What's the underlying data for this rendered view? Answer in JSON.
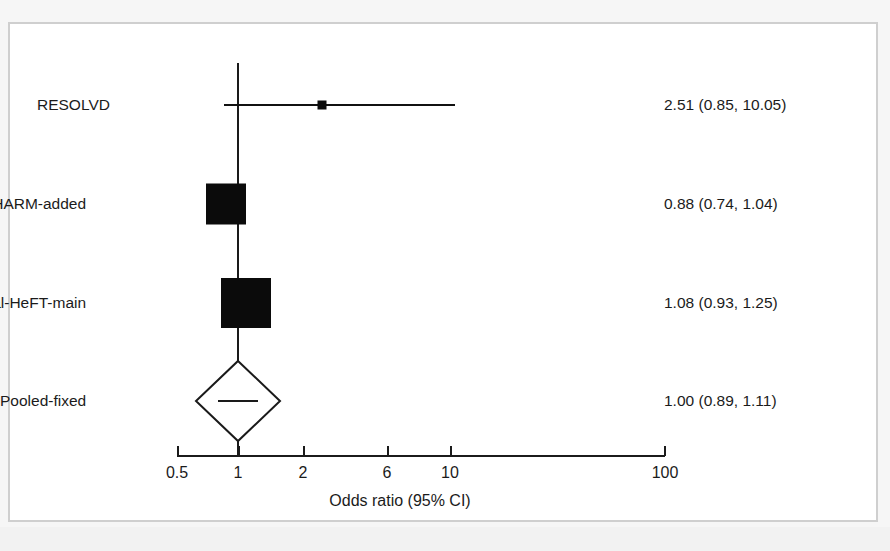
{
  "figure": {
    "type": "forest-plot",
    "frame_color": "#cfcfcf",
    "marker_color": "#0b0b0b",
    "background": "#ffffff"
  },
  "chart_data": {
    "type": "scatter",
    "title": "",
    "subtitle": "",
    "xlabel": "Odds ratio (95% CI)",
    "ylabel": "",
    "scale": "log",
    "xlim": [
      0.5,
      100
    ],
    "grid": false,
    "legend": "none",
    "reference_line": 1,
    "tick_values": [
      0.5,
      1,
      2,
      6,
      10,
      100
    ],
    "tick_labels": [
      "0.5",
      "1",
      "2",
      "6",
      "10",
      "100"
    ],
    "categories": [
      "RESOLVD",
      "CHARM-added",
      "Val-HeFT-main",
      "Pooled-fixed"
    ],
    "series": [
      {
        "name": "Odds ratio",
        "points": [
          {
            "study": "RESOLVD",
            "estimate": 2.51,
            "ci_low": 0.85,
            "ci_high": 10.05,
            "stat_text": "2.51 (0.85, 10.05)",
            "marker": "square",
            "weight": 0.04
          },
          {
            "study": "CHARM-added",
            "estimate": 0.88,
            "ci_low": 0.74,
            "ci_high": 1.04,
            "stat_text": "0.88 (0.74, 1.04)",
            "marker": "square",
            "weight": 0.45
          },
          {
            "study": "Val-HeFT-main",
            "estimate": 1.08,
            "ci_low": 0.93,
            "ci_high": 1.25,
            "stat_text": "1.08 (0.93, 1.25)",
            "marker": "square",
            "weight": 0.51
          },
          {
            "study": "Pooled-fixed",
            "estimate": 1.0,
            "ci_low": 0.89,
            "ci_high": 1.11,
            "stat_text": "1.00 (0.89, 1.11)",
            "marker": "diamond",
            "weight": 1.0
          }
        ]
      }
    ]
  },
  "rows": [
    {
      "label": "RESOLVD",
      "stat": "2.51 (0.85, 10.05)"
    },
    {
      "label": "CHARM-added",
      "stat": "0.88 (0.74, 1.04)"
    },
    {
      "label": "Val-HeFT-main",
      "stat": "1.08 (0.93, 1.25)"
    },
    {
      "label": "Pooled-fixed",
      "stat": "1.00 (0.89, 1.11)"
    }
  ],
  "axis": {
    "title": "Odds ratio (95% CI)",
    "ticks": [
      "0.5",
      "1",
      "2",
      "6",
      "10",
      "100"
    ]
  }
}
